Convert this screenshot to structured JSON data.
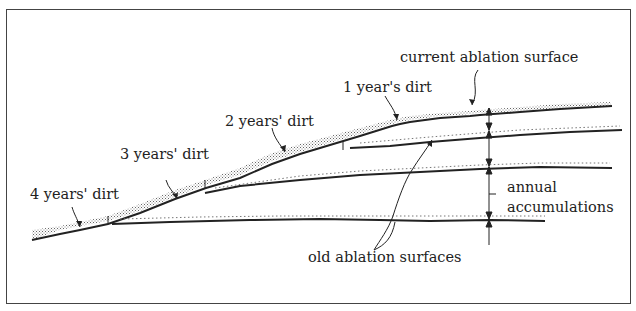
{
  "diagram": {
    "type": "cross-section",
    "labels": {
      "current_surface": "current ablation surface",
      "dirt_1": "1 year's dirt",
      "dirt_2": "2 years' dirt",
      "dirt_3": "3 years' dirt",
      "dirt_4": "4 years' dirt",
      "annual_1": "annual",
      "annual_2": "accumulations",
      "old_surfaces": "old ablation surfaces"
    },
    "colors": {
      "line": "#222222",
      "frame": "#444444",
      "stipple": "#777777",
      "background": "#ffffff"
    }
  }
}
